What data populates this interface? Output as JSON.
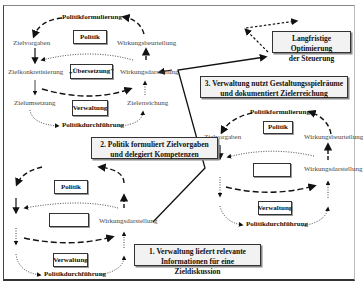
{
  "diagram": {
    "cycle_top_left": {
      "top_label": "Politikformulierung",
      "bottom_label": "Politikdurchführung",
      "box_top": "Politik",
      "box_middle": "„Übersetzung\"",
      "box_bottom": "Verwaltung",
      "left_labels": [
        "Zielvorgaben",
        "Zielkonkretisierung",
        "Zielumsetzung"
      ],
      "right_labels": [
        "Wirkungsbeurteilung",
        "Wirkungsdarstellung",
        "Zielerreichung"
      ]
    },
    "cycle_bottom_left": {
      "box_top": "Politik",
      "box_middle": "",
      "box_bottom": "Verwaltung",
      "right_label": "Wirkungsdarstellung",
      "bottom_label": "Politikdurchführung"
    },
    "cycle_right": {
      "top_label": "Politikformulierung",
      "bottom_label": "Politikdurchführung",
      "box_top": "Politik",
      "box_middle": "",
      "box_bottom": "Verwaltung",
      "left_label": "Zielvorgaben",
      "right_labels": [
        "Wirkungsbeurteilung",
        "Wirkungsdarstellung"
      ]
    },
    "callouts": {
      "step1": [
        "1. Verwaltung liefert relevante",
        "Informationen für eine Zieldiskussion"
      ],
      "step2": [
        "2. Politik formuliert Zielvorgaben",
        "und delegiert Kompetenzen"
      ],
      "step3": [
        "3. Verwaltung nutzt Gestaltungsspielräume",
        "und dokumentiert Zielerreichung"
      ],
      "goal": [
        "Langfristige Optimierung",
        "der Steuerung"
      ]
    },
    "colors": {
      "line": "#111111",
      "text": "#444444",
      "callout_bg": "#f2f2f2"
    }
  }
}
